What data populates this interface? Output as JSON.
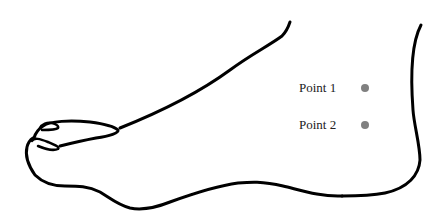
{
  "diagram": {
    "stroke_color": "#000000",
    "background": "#ffffff"
  },
  "points": [
    {
      "label": "Point 1",
      "color": "#808080"
    },
    {
      "label": "Point 2",
      "color": "#808080"
    }
  ]
}
